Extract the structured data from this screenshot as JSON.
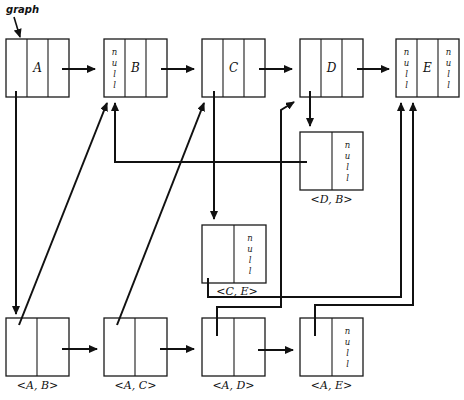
{
  "diagram": {
    "type": "adjacency multilist representation of a graph",
    "pointer_label": "graph",
    "colors": {
      "ink": "#111111",
      "background": "#ffffff"
    },
    "null_text": "null",
    "vertices": [
      {
        "id": "A",
        "label": "A",
        "x": 6,
        "y": 39,
        "w": 63,
        "h": 58,
        "cells": [
          "",
          "A",
          ""
        ]
      },
      {
        "id": "B",
        "label": "B",
        "x": 104,
        "y": 39,
        "w": 63,
        "h": 58,
        "cells": [
          "null",
          "B",
          ""
        ]
      },
      {
        "id": "C",
        "label": "C",
        "x": 202,
        "y": 39,
        "w": 63,
        "h": 58,
        "cells": [
          "",
          "C",
          ""
        ]
      },
      {
        "id": "D",
        "label": "D",
        "x": 300,
        "y": 39,
        "w": 63,
        "h": 58,
        "cells": [
          "",
          "D",
          ""
        ]
      },
      {
        "id": "E",
        "label": "E",
        "x": 396,
        "y": 39,
        "w": 63,
        "h": 58,
        "cells": [
          "null",
          "E",
          "null"
        ]
      }
    ],
    "edges": [
      {
        "id": "AB",
        "label": "<A, B>",
        "x": 6,
        "y": 318,
        "w": 63,
        "h": 58,
        "cells": [
          "",
          ""
        ]
      },
      {
        "id": "AC",
        "label": "<A, C>",
        "x": 104,
        "y": 318,
        "w": 63,
        "h": 58,
        "cells": [
          "",
          ""
        ]
      },
      {
        "id": "AD",
        "label": "<A, D>",
        "x": 202,
        "y": 318,
        "w": 63,
        "h": 58,
        "cells": [
          "",
          ""
        ]
      },
      {
        "id": "AE",
        "label": "<A, E>",
        "x": 300,
        "y": 318,
        "w": 63,
        "h": 58,
        "cells": [
          "",
          "null"
        ]
      },
      {
        "id": "DB",
        "label": "<D, B>",
        "x": 300,
        "y": 132,
        "w": 63,
        "h": 58,
        "cells": [
          "",
          "null"
        ]
      },
      {
        "id": "CE",
        "label": "<C, E>",
        "x": 202,
        "y": 225,
        "w": 63,
        "h": 58,
        "cells": [
          "",
          "null"
        ]
      }
    ],
    "links": [
      {
        "from": "A",
        "to": "B",
        "kind": "vertex-next"
      },
      {
        "from": "B",
        "to": "C",
        "kind": "vertex-next"
      },
      {
        "from": "C",
        "to": "D",
        "kind": "vertex-next"
      },
      {
        "from": "D",
        "to": "E",
        "kind": "vertex-next"
      },
      {
        "from": "A",
        "to": "<A, B>",
        "kind": "adjacency"
      },
      {
        "from": "<A, B>",
        "to": "<A, C>",
        "kind": "edge-next"
      },
      {
        "from": "<A, C>",
        "to": "<A, D>",
        "kind": "edge-next"
      },
      {
        "from": "<A, D>",
        "to": "<A, E>",
        "kind": "edge-next"
      },
      {
        "from": "<A, B>",
        "to": "B",
        "kind": "vertex"
      },
      {
        "from": "<A, C>",
        "to": "C",
        "kind": "vertex"
      },
      {
        "from": "<A, D>",
        "to": "D",
        "kind": "vertex"
      },
      {
        "from": "<A, E>",
        "to": "E",
        "kind": "vertex"
      },
      {
        "from": "C",
        "to": "<C, E>",
        "kind": "adjacency"
      },
      {
        "from": "<C, E>",
        "to": "E",
        "kind": "vertex"
      },
      {
        "from": "D",
        "to": "<D, B>",
        "kind": "adjacency"
      },
      {
        "from": "<D, B>",
        "to": "B",
        "kind": "vertex"
      }
    ],
    "caption": ""
  }
}
